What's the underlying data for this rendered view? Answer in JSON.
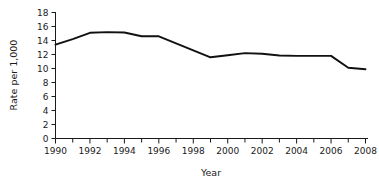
{
  "chart_data": {
    "type": "line",
    "title": "",
    "xlabel": "Year",
    "ylabel": "Rate per 1,000",
    "x": [
      1990,
      1991,
      1992,
      1993,
      1994,
      1995,
      1996,
      1997,
      1998,
      1999,
      2000,
      2001,
      2002,
      2003,
      2004,
      2005,
      2006,
      2007,
      2008
    ],
    "values": [
      13.4,
      14.2,
      15.1,
      15.2,
      15.15,
      14.6,
      14.6,
      13.6,
      12.6,
      11.6,
      11.9,
      12.2,
      12.1,
      11.85,
      11.8,
      11.8,
      11.8,
      10.1,
      9.9
    ],
    "series": [
      {
        "name": "Rate per 1,000",
        "values": [
          13.4,
          14.2,
          15.1,
          15.2,
          15.15,
          14.6,
          14.6,
          13.6,
          12.6,
          11.6,
          11.9,
          12.2,
          12.1,
          11.85,
          11.8,
          11.8,
          11.8,
          10.1,
          9.9
        ]
      }
    ],
    "xlim": [
      1990,
      2008
    ],
    "ylim": [
      0,
      18
    ],
    "y_ticks": [
      0,
      2,
      4,
      6,
      8,
      10,
      12,
      14,
      16,
      18
    ],
    "y_tick_labels": [
      "0",
      "2",
      "4",
      "6",
      "8",
      "10",
      "12",
      "14",
      "16",
      "18"
    ],
    "x_ticks": [
      1990,
      1992,
      1994,
      1996,
      1998,
      2000,
      2002,
      2004,
      2006,
      2008
    ],
    "x_tick_labels": [
      "1990",
      "1992",
      "1994",
      "1996",
      "1998",
      "2000",
      "2002",
      "2004",
      "2006",
      "2008"
    ],
    "x_minor_ticks": [
      1991,
      1993,
      1995,
      1997,
      1999,
      2001,
      2003,
      2005,
      2007
    ],
    "grid": false,
    "legend": false,
    "legend_position": "none",
    "line_color": "#111111",
    "axis_color": "#1a1a1a",
    "background_color": "#ffffff"
  }
}
